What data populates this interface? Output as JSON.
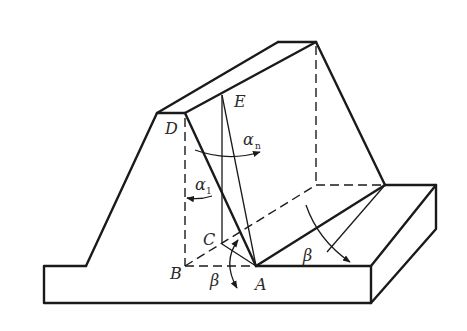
{
  "diagram": {
    "labels": {
      "D": "D",
      "E": "E",
      "C": "C",
      "B": "B",
      "A": "A",
      "alpha_n": "α",
      "alpha_n_sub": "n",
      "alpha_1": "α",
      "alpha_1_sub": "1",
      "beta_left": "β",
      "beta_right": "β"
    },
    "colors": {
      "line": "#1a1a1a",
      "text": "#2a2a2a",
      "background": "#ffffff"
    }
  }
}
